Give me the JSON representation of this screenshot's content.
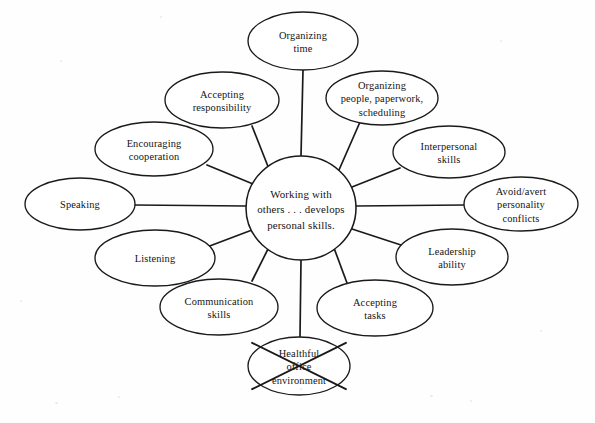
{
  "diagram": {
    "type": "cluster-web",
    "center": {
      "id": "center",
      "text": "Working with\nothers . . . develops\npersonal skills.",
      "lines": [
        "Working with",
        "others . . . develops",
        "personal skills."
      ],
      "cx": 301,
      "cy": 208,
      "rx": 55,
      "ry": 52
    },
    "line_color": "#1a1a1a",
    "node_fill": "#ffffff",
    "background": "#ffffff",
    "nodes": [
      {
        "id": "organizing-time",
        "lines": [
          "Organizing",
          "time"
        ],
        "cx": 303,
        "cy": 41,
        "rx": 55,
        "ry": 29,
        "struck": false,
        "spoke": {
          "x1": 301,
          "y1": 156,
          "x2": 303,
          "y2": 70
        }
      },
      {
        "id": "organizing-people-paperwork-scheduling",
        "lines": [
          "Organizing",
          "people, paperwork,",
          "scheduling"
        ],
        "cx": 382,
        "cy": 98,
        "rx": 56,
        "ry": 27,
        "struck": false,
        "spoke": {
          "x1": 339,
          "y1": 170,
          "x2": 360,
          "y2": 122
        }
      },
      {
        "id": "interpersonal-skills",
        "lines": [
          "Interpersonal",
          "skills"
        ],
        "cx": 449,
        "cy": 152,
        "rx": 56,
        "ry": 26,
        "struck": false,
        "spoke": {
          "x1": 352,
          "y1": 187,
          "x2": 400,
          "y2": 168
        }
      },
      {
        "id": "avoid-avert-personality-conflicts",
        "lines": [
          "Avoid/avert",
          "personality",
          "conflicts"
        ],
        "cx": 521,
        "cy": 204,
        "rx": 57,
        "ry": 27,
        "struck": false,
        "spoke": {
          "x1": 356,
          "y1": 206,
          "x2": 464,
          "y2": 205
        }
      },
      {
        "id": "leadership-ability",
        "lines": [
          "Leadership",
          "ability"
        ],
        "cx": 452,
        "cy": 257,
        "rx": 56,
        "ry": 28,
        "struck": false,
        "spoke": {
          "x1": 349,
          "y1": 228,
          "x2": 404,
          "y2": 246
        }
      },
      {
        "id": "accepting-tasks",
        "lines": [
          "Accepting",
          "tasks"
        ],
        "cx": 375,
        "cy": 308,
        "rx": 58,
        "ry": 28,
        "struck": false,
        "spoke": {
          "x1": 334,
          "y1": 248,
          "x2": 347,
          "y2": 283
        }
      },
      {
        "id": "healthful-office-environment",
        "lines": [
          "Healthful",
          "office",
          "environment"
        ],
        "cx": 299,
        "cy": 366,
        "rx": 51,
        "ry": 29,
        "struck": true,
        "spoke": {
          "x1": 301,
          "y1": 260,
          "x2": 300,
          "y2": 337
        }
      },
      {
        "id": "communication-skills",
        "lines": [
          "Communication",
          "skills"
        ],
        "cx": 219,
        "cy": 307,
        "rx": 59,
        "ry": 28,
        "struck": false,
        "spoke": {
          "x1": 268,
          "y1": 249,
          "x2": 252,
          "y2": 281
        }
      },
      {
        "id": "listening",
        "lines": [
          "Listening"
        ],
        "cx": 155,
        "cy": 258,
        "rx": 60,
        "ry": 28,
        "struck": false,
        "spoke": {
          "x1": 252,
          "y1": 230,
          "x2": 207,
          "y2": 247
        }
      },
      {
        "id": "speaking",
        "lines": [
          "Speaking"
        ],
        "cx": 80,
        "cy": 204,
        "rx": 55,
        "ry": 26,
        "struck": false,
        "spoke": {
          "x1": 246,
          "y1": 206,
          "x2": 134,
          "y2": 205
        }
      },
      {
        "id": "encouraging-cooperation",
        "lines": [
          "Encouraging",
          "cooperation"
        ],
        "cx": 154,
        "cy": 149,
        "rx": 59,
        "ry": 27,
        "struck": false,
        "spoke": {
          "x1": 253,
          "y1": 184,
          "x2": 207,
          "y2": 165
        }
      },
      {
        "id": "accepting-responsibility",
        "lines": [
          "Accepting",
          "responsibility"
        ],
        "cx": 222,
        "cy": 100,
        "rx": 57,
        "ry": 28,
        "struck": false,
        "spoke": {
          "x1": 269,
          "y1": 169,
          "x2": 252,
          "y2": 126
        }
      }
    ]
  }
}
